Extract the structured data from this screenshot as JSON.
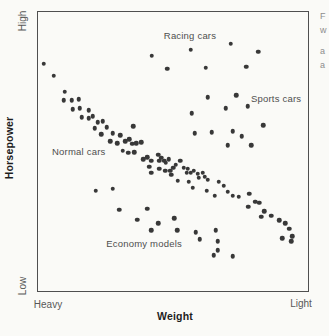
{
  "figure": {
    "y_axis": {
      "title": "Horsepower",
      "top_label": "High",
      "bottom_label": "Low"
    },
    "x_axis": {
      "title": "Weight",
      "left_label": "Heavy",
      "right_label": "Light"
    },
    "colors": {
      "dot": "#383838",
      "plot_border": "#4f4f4f",
      "cluster_label": "#4e4e4e",
      "axis_title": "#1e1e1e",
      "background": "#fafaf7"
    }
  },
  "caption_fragments": [
    {
      "text": "F",
      "y": 11
    },
    {
      "text": "w",
      "y": 25
    },
    {
      "text": "a",
      "y": 46
    },
    {
      "text": "a",
      "y": 60
    }
  ],
  "chart_data": {
    "type": "scatter",
    "title": "",
    "xlabel": "Weight",
    "ylabel": "Horsepower",
    "x_range_labels": [
      "Heavy",
      "Light"
    ],
    "y_range_labels": [
      "Low",
      "High"
    ],
    "xlim": [
      0,
      100
    ],
    "ylim": [
      0,
      100
    ],
    "grid": false,
    "legend": false,
    "units_note": "normalized 0-100; x: 0=Heavy 100=Light, y: 0=Low 100=High",
    "annotations": [
      {
        "text": "Racing cars",
        "x": 56.3,
        "y": 91.8
      },
      {
        "text": "Sports cars",
        "x": 88.2,
        "y": 69.0
      },
      {
        "text": "Normal cars",
        "x": 15.1,
        "y": 50.2
      },
      {
        "text": "Economy models",
        "x": 39.3,
        "y": 17.1
      }
    ],
    "points": [
      [
        2.2,
        81.5
      ],
      [
        5.9,
        77.2
      ],
      [
        9.9,
        71.5
      ],
      [
        9.6,
        68.3
      ],
      [
        12.5,
        68.3
      ],
      [
        15.1,
        68.7
      ],
      [
        12.9,
        65.1
      ],
      [
        15.4,
        65.5
      ],
      [
        18.8,
        64.8
      ],
      [
        16.2,
        62.3
      ],
      [
        18.8,
        61.9
      ],
      [
        20.2,
        62.6
      ],
      [
        22.1,
        60.5
      ],
      [
        23.9,
        60.9
      ],
      [
        21.0,
        58.4
      ],
      [
        25.4,
        58.7
      ],
      [
        23.5,
        56.2
      ],
      [
        27.6,
        56.6
      ],
      [
        30.5,
        55.9
      ],
      [
        35.3,
        59.1
      ],
      [
        26.8,
        53.7
      ],
      [
        29.4,
        53.0
      ],
      [
        32.4,
        53.7
      ],
      [
        33.8,
        54.4
      ],
      [
        34.9,
        52.7
      ],
      [
        36.4,
        53.0
      ],
      [
        38.2,
        53.4
      ],
      [
        31.3,
        50.2
      ],
      [
        33.5,
        49.5
      ],
      [
        35.7,
        49.8
      ],
      [
        39.0,
        47.3
      ],
      [
        40.4,
        48.0
      ],
      [
        41.9,
        46.6
      ],
      [
        44.5,
        48.8
      ],
      [
        44.9,
        46.6
      ],
      [
        45.6,
        47.7
      ],
      [
        46.7,
        46.6
      ],
      [
        47.4,
        45.9
      ],
      [
        48.5,
        47.3
      ],
      [
        41.2,
        44.5
      ],
      [
        44.9,
        43.8
      ],
      [
        47.1,
        43.1
      ],
      [
        48.9,
        43.1
      ],
      [
        50.0,
        44.1
      ],
      [
        51.1,
        45.2
      ],
      [
        52.6,
        46.6
      ],
      [
        41.9,
        42.3
      ],
      [
        54.0,
        44.1
      ],
      [
        55.5,
        43.8
      ],
      [
        56.6,
        42.3
      ],
      [
        57.7,
        43.1
      ],
      [
        59.2,
        42.0
      ],
      [
        49.3,
        41.6
      ],
      [
        51.8,
        39.5
      ],
      [
        55.1,
        42.3
      ],
      [
        55.9,
        39.1
      ],
      [
        59.6,
        40.6
      ],
      [
        61.0,
        42.3
      ],
      [
        61.8,
        40.9
      ],
      [
        62.9,
        39.9
      ],
      [
        57.4,
        37.0
      ],
      [
        62.5,
        35.9
      ],
      [
        66.9,
        39.1
      ],
      [
        68.8,
        37.7
      ],
      [
        70.2,
        35.6
      ],
      [
        72.1,
        34.2
      ],
      [
        74.3,
        33.8
      ],
      [
        65.4,
        34.2
      ],
      [
        78.3,
        34.9
      ],
      [
        80.5,
        32.0
      ],
      [
        82.0,
        31.7
      ],
      [
        77.9,
        30.2
      ],
      [
        83.8,
        28.5
      ],
      [
        82.7,
        26.7
      ],
      [
        86.4,
        27.0
      ],
      [
        89.3,
        25.3
      ],
      [
        91.5,
        24.2
      ],
      [
        93.0,
        22.4
      ],
      [
        94.1,
        19.6
      ],
      [
        90.4,
        18.9
      ],
      [
        93.8,
        17.8
      ],
      [
        21.3,
        35.9
      ],
      [
        27.6,
        36.7
      ],
      [
        30.1,
        29.2
      ],
      [
        40.4,
        29.5
      ],
      [
        36.8,
        25.6
      ],
      [
        44.5,
        24.2
      ],
      [
        50.4,
        26.0
      ],
      [
        41.9,
        21.7
      ],
      [
        51.5,
        21.7
      ],
      [
        58.5,
        21.0
      ],
      [
        59.9,
        18.5
      ],
      [
        65.8,
        21.7
      ],
      [
        66.5,
        17.8
      ],
      [
        66.5,
        14.6
      ],
      [
        65.1,
        12.8
      ],
      [
        72.1,
        12.5
      ],
      [
        42.2,
        84.3
      ],
      [
        47.8,
        79.7
      ],
      [
        56.6,
        86.5
      ],
      [
        62.1,
        80.1
      ],
      [
        71.3,
        88.6
      ],
      [
        77.2,
        80.4
      ],
      [
        81.6,
        85.8
      ],
      [
        62.9,
        69.4
      ],
      [
        73.5,
        70.1
      ],
      [
        77.6,
        66.2
      ],
      [
        69.5,
        65.5
      ],
      [
        57.0,
        63.7
      ],
      [
        83.5,
        59.4
      ],
      [
        58.1,
        56.6
      ],
      [
        64.3,
        56.9
      ],
      [
        72.1,
        57.3
      ],
      [
        75.4,
        55.5
      ],
      [
        70.2,
        52.3
      ],
      [
        79.0,
        52.3
      ]
    ]
  }
}
